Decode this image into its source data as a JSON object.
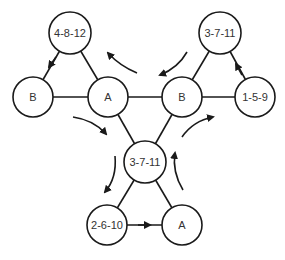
{
  "diagram": {
    "nodes": [
      {
        "id": "n1",
        "label": "4-8-12",
        "x": 70,
        "y": 33
      },
      {
        "id": "n2",
        "label": "3-7-11",
        "x": 220,
        "y": 33
      },
      {
        "id": "n3",
        "label": "B",
        "x": 33,
        "y": 97
      },
      {
        "id": "n4",
        "label": "A",
        "x": 108,
        "y": 97
      },
      {
        "id": "n5",
        "label": "B",
        "x": 182,
        "y": 97
      },
      {
        "id": "n6",
        "label": "1-5-9",
        "x": 255,
        "y": 97
      },
      {
        "id": "n7",
        "label": "3-7-11",
        "x": 145,
        "y": 162
      },
      {
        "id": "n8",
        "label": "2-6-10",
        "x": 107,
        "y": 225
      },
      {
        "id": "n9",
        "label": "A",
        "x": 182,
        "y": 225
      }
    ],
    "edges": [
      {
        "from": "n1",
        "to": "n3",
        "directed": true
      },
      {
        "from": "n1",
        "to": "n4",
        "directed": false
      },
      {
        "from": "n3",
        "to": "n4",
        "directed": false
      },
      {
        "from": "n4",
        "to": "n5",
        "directed": false
      },
      {
        "from": "n5",
        "to": "n6",
        "directed": false
      },
      {
        "from": "n5",
        "to": "n2",
        "directed": false
      },
      {
        "from": "n6",
        "to": "n2",
        "directed": true
      },
      {
        "from": "n4",
        "to": "n7",
        "directed": false
      },
      {
        "from": "n5",
        "to": "n7",
        "directed": false
      },
      {
        "from": "n7",
        "to": "n8",
        "directed": false
      },
      {
        "from": "n7",
        "to": "n9",
        "directed": false
      },
      {
        "from": "n8",
        "to": "n9",
        "directed": true
      }
    ],
    "rotation_arrows": [
      {
        "position": "top-left",
        "direction": "counterclockwise"
      },
      {
        "position": "top-right",
        "direction": "counterclockwise"
      },
      {
        "position": "middle-left",
        "direction": "clockwise"
      },
      {
        "position": "middle-right",
        "direction": "clockwise"
      },
      {
        "position": "bottom-left",
        "direction": "counterclockwise"
      },
      {
        "position": "bottom-right",
        "direction": "counterclockwise"
      }
    ],
    "colors": {
      "stroke": "#1a1a1a",
      "text": "#333333",
      "background": "#ffffff"
    }
  }
}
